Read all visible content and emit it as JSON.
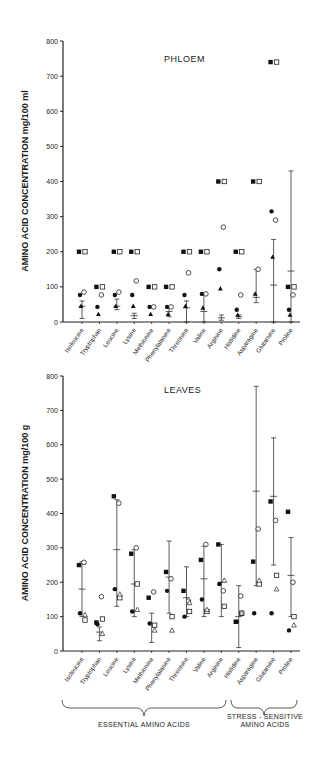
{
  "chart_data": [
    {
      "type": "scatter",
      "title": "PHLOEM",
      "xlabel": "",
      "ylabel": "AMINO ACID CONCENTRATION mg/100 ml",
      "ylim": [
        0,
        800
      ],
      "yticks": [
        0,
        100,
        200,
        300,
        400,
        500,
        600,
        700,
        800
      ],
      "grid": false,
      "categories": [
        "Isoleucine",
        "Tryptophan",
        "Leucine",
        "Lysine",
        "Methionine",
        "Phenylalanine",
        "Threonine",
        "Valine",
        "Arginine",
        "Histidine",
        "Asparagine",
        "Glutamine",
        "Proline"
      ],
      "series": [
        {
          "name": "filled-square",
          "marker": "filled-square",
          "values": [
            200,
            100,
            200,
            200,
            100,
            100,
            200,
            200,
            400,
            200,
            400,
            740,
            100
          ]
        },
        {
          "name": "open-square",
          "marker": "open-square",
          "values": [
            200,
            100,
            200,
            200,
            100,
            100,
            200,
            200,
            400,
            200,
            400,
            740,
            100
          ]
        },
        {
          "name": "filled-circle",
          "marker": "filled-circle",
          "values": [
            77,
            43,
            77,
            77,
            43,
            43,
            77,
            80,
            150,
            35,
            null,
            315,
            35
          ]
        },
        {
          "name": "open-circle",
          "marker": "open-circle",
          "values": [
            85,
            77,
            85,
            117,
            43,
            43,
            140,
            80,
            270,
            77,
            150,
            290,
            77
          ]
        },
        {
          "name": "filled-triangle",
          "marker": "filled-triangle",
          "values": [
            45,
            22,
            45,
            45,
            22,
            22,
            45,
            40,
            95,
            20,
            80,
            185,
            20
          ]
        }
      ],
      "error_bars": [
        {
          "mean": 45,
          "low": 10,
          "high": 60
        },
        null,
        {
          "mean": 45,
          "low": 35,
          "high": 65
        },
        {
          "mean": 18,
          "low": 10,
          "high": 25
        },
        null,
        {
          "mean": 30,
          "low": 15,
          "high": 40
        },
        {
          "mean": 40,
          "low": 0,
          "high": 60
        },
        {
          "mean": 30,
          "low": 0,
          "high": 80
        },
        {
          "mean": 12,
          "low": 5,
          "high": 20
        },
        {
          "mean": 15,
          "low": 10,
          "high": 20
        },
        {
          "mean": 70,
          "low": 55,
          "high": 150
        },
        {
          "mean": 105,
          "low": 0,
          "high": 235
        },
        {
          "mean": 145,
          "low": 0,
          "high": 430
        }
      ]
    },
    {
      "type": "scatter",
      "title": "LEAVES",
      "xlabel": "",
      "ylabel": "AMINO ACID CONCENTRATION mg/100 g",
      "ylim": [
        0,
        800
      ],
      "yticks": [
        0,
        100,
        200,
        300,
        400,
        500,
        600,
        700,
        800
      ],
      "grid": false,
      "categories": [
        "Isoleucine",
        "Tryptophan",
        "Leucine",
        "Lysine",
        "Methionine",
        "Phenylalanine",
        "Threonine",
        "Valine",
        "Arginine",
        "Histidine",
        "Asparagine",
        "Glutamine",
        "Proline"
      ],
      "series": [
        {
          "name": "filled-square",
          "marker": "filled-square",
          "values": [
            250,
            83,
            450,
            283,
            155,
            230,
            175,
            265,
            310,
            85,
            260,
            435,
            405
          ]
        },
        {
          "name": "open-square",
          "marker": "open-square",
          "values": [
            90,
            93,
            155,
            195,
            75,
            100,
            115,
            115,
            130,
            110,
            195,
            220,
            100
          ]
        },
        {
          "name": "filled-circle",
          "marker": "filled-circle",
          "values": [
            110,
            78,
            180,
            115,
            80,
            175,
            100,
            150,
            195,
            85,
            110,
            110,
            60
          ]
        },
        {
          "name": "open-circle",
          "marker": "open-circle",
          "values": [
            258,
            158,
            430,
            300,
            172,
            210,
            145,
            310,
            175,
            160,
            355,
            380,
            200
          ]
        },
        {
          "name": "open-triangle",
          "marker": "open-triangle",
          "values": [
            105,
            50,
            165,
            120,
            60,
            60,
            140,
            120,
            205,
            110,
            205,
            180,
            75
          ]
        }
      ],
      "error_bars": [
        {
          "mean": 180,
          "low": 100,
          "high": 260
        },
        {
          "mean": 55,
          "low": 30,
          "high": 70
        },
        {
          "mean": 295,
          "low": 130,
          "high": 440
        },
        {
          "mean": 195,
          "low": 100,
          "high": 295
        },
        {
          "mean": 80,
          "low": 25,
          "high": 110
        },
        {
          "mean": 215,
          "low": 110,
          "high": 320
        },
        {
          "mean": 155,
          "low": 100,
          "high": 245
        },
        {
          "mean": 210,
          "low": 100,
          "high": 305
        },
        {
          "mean": 200,
          "low": 100,
          "high": 310
        },
        {
          "mean": 100,
          "low": 10,
          "high": 190
        },
        {
          "mean": 465,
          "low": 190,
          "high": 770
        },
        {
          "mean": 450,
          "low": 250,
          "high": 620
        },
        {
          "mean": 220,
          "low": 100,
          "high": 330
        }
      ]
    }
  ],
  "groups": {
    "essential": "ESSENTIAL AMINO ACIDS",
    "stress_line1": "STRESS - SENSITIVE",
    "stress_line2": "AMINO ACIDS"
  }
}
